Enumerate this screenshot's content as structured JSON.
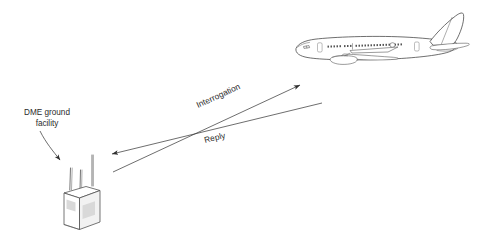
{
  "figure": {
    "background_color": "#ffffff",
    "line_color": "#3a3a3a",
    "text_color": "#2b2b2b",
    "panel_color": "#d9d9d9"
  },
  "ground_station": {
    "label_line1": "DME ground",
    "label_line2": "facility",
    "callout_arrow": "curved-arrow-pointing-to-ground-station",
    "antenna_count": 3
  },
  "aircraft": {
    "name": "airliner-side-view",
    "heading": "left"
  },
  "signals": [
    {
      "id": "interrogation",
      "label": "Interrogation",
      "direction": "ground-to-aircraft",
      "arrowhead": "right"
    },
    {
      "id": "reply",
      "label": "Reply",
      "direction": "aircraft-to-ground",
      "arrowhead": "left"
    }
  ]
}
